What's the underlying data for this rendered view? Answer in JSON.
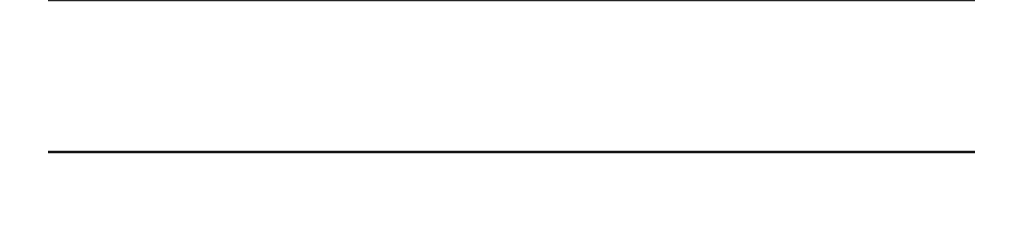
{
  "chart_data": [
    {
      "type": "scatter",
      "title": "",
      "xlabel": "Number of delays",
      "ylabel": "",
      "xlim": [
        0,
        100
      ],
      "tick_labels": [
        "0",
        "10",
        "20",
        "30",
        "40",
        "50",
        "60",
        "70",
        "80",
        "90",
        "100"
      ],
      "ticks": [
        0,
        10,
        20,
        30,
        40,
        50,
        60,
        70,
        80,
        90,
        100
      ],
      "grid": false,
      "note": "Top dot plot cropped; only axis visible",
      "values": []
    },
    {
      "type": "scatter",
      "subtype": "dot-plot",
      "title": "",
      "xlabel": "Rate per 10,000 flights",
      "ylabel": "",
      "xlim": [
        0.0,
        5.0
      ],
      "tick_labels": [
        "0.0",
        "0.5",
        "1.0",
        "1.5",
        "2.0",
        "2.5",
        "3.0",
        "3.5",
        "4.0",
        "4.5",
        "5.0"
      ],
      "ticks": [
        0.0,
        0.5,
        1.0,
        1.5,
        2.0,
        2.5,
        3.0,
        3.5,
        4.0,
        4.5,
        5.0
      ],
      "grid": false,
      "dot_color": "#b3b3b3",
      "values": [
        0.1,
        0.4,
        0.6,
        0.7,
        0.8,
        0.9,
        1.1,
        1.1,
        1.2,
        1.3,
        1.4,
        1.6,
        1.6,
        2.7,
        2.8,
        4.1,
        4.9
      ]
    }
  ]
}
